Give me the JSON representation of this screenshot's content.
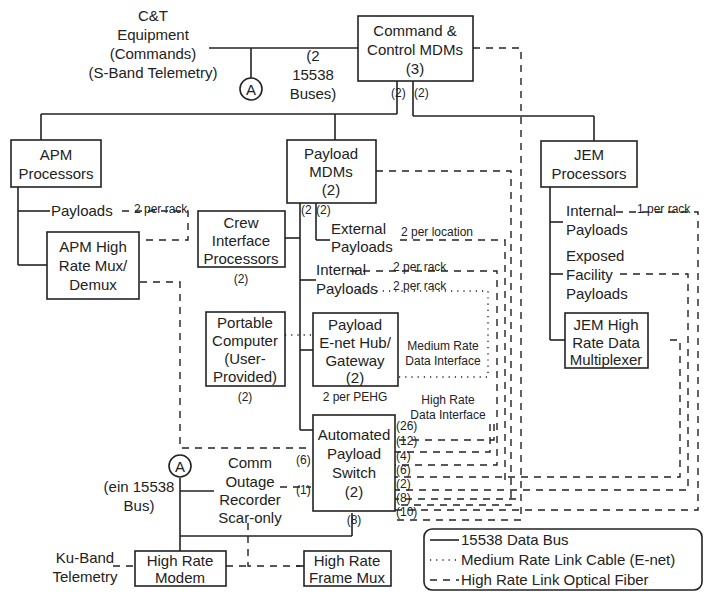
{
  "colors": {
    "line": "#222222",
    "background": "#ffffff"
  },
  "external": {
    "ct_equipment": [
      "C&T",
      "Equipment",
      "(Commands)",
      "(S-Band Telemetry)"
    ],
    "bus_note": [
      "(2",
      "15538",
      "Buses)"
    ],
    "connector_a_top": "A",
    "connector_a_bottom": "A",
    "ein_bus": [
      "(ein 15538",
      "Bus)"
    ],
    "ku_band": [
      "Ku-Band",
      "Telemetry"
    ]
  },
  "boxes": {
    "cc_mdms": [
      "Command &",
      "Control MDMs",
      "(3)"
    ],
    "apm_processors": [
      "APM",
      "Processors"
    ],
    "payload_mdms": [
      "Payload",
      "MDMs",
      "(2)"
    ],
    "jem_processors": [
      "JEM",
      "Processors"
    ],
    "crew_interface": [
      "Crew",
      "Interface",
      "Processors"
    ],
    "apm_mux": [
      "APM High",
      "Rate Mux/",
      "Demux"
    ],
    "portable_computer": [
      "Portable",
      "Computer",
      "(User-",
      "Provided)"
    ],
    "pehg": [
      "Payload",
      "E-net Hub/",
      "Gateway",
      "(2)"
    ],
    "jem_hrdm": [
      "JEM High",
      "Rate Data",
      "Multiplexer"
    ],
    "aps": [
      "Automated",
      "Payload",
      "Switch",
      "(2)"
    ],
    "hr_modem": [
      "High Rate",
      "Modem"
    ],
    "hr_frame_mux": [
      "High Rate",
      "Frame Mux"
    ]
  },
  "labels": {
    "cc_left_count": "(2)",
    "cc_right_count": "(2)",
    "pmdm_left_count": "(2",
    "pmdm_right_count": "(2)",
    "apm_payloads": "Payloads",
    "apm_per_rack": "2 per rack",
    "crew_count": "(2)",
    "external_payloads": [
      "External",
      "Payloads"
    ],
    "per_location": "2 per location",
    "internal_payloads": [
      "Internal",
      "Payloads"
    ],
    "per_rack_1": "2 per rack",
    "per_rack_2": "2 per rack",
    "portable_count": "(2)",
    "per_pehg": "2 per PEHG",
    "medium_rate": [
      "Medium Rate",
      "Data Interface"
    ],
    "high_rate": [
      "High Rate",
      "Data Interface"
    ],
    "jem_internal": [
      "Internal",
      "Payloads"
    ],
    "jem_per_rack": "1 per rack",
    "jem_exposed": [
      "Exposed",
      "Facility",
      "Payloads"
    ],
    "aps_left_6": "(6)",
    "aps_left_1": "(1)",
    "aps_bottom_8": "(8)",
    "aps_right_ports": [
      "(26)",
      "(12)",
      "(4)",
      "(6)",
      "(2)",
      "(8)",
      "(10)"
    ],
    "comm_outage": [
      "Comm",
      "Outage",
      "Recorder",
      "Scar-only"
    ]
  },
  "legend": {
    "items": [
      {
        "style": "solid",
        "label": "15538 Data Bus"
      },
      {
        "style": "dotted",
        "label": "Medium Rate Link Cable (E-net)"
      },
      {
        "style": "dashed",
        "label": "High Rate Link Optical Fiber"
      }
    ]
  }
}
